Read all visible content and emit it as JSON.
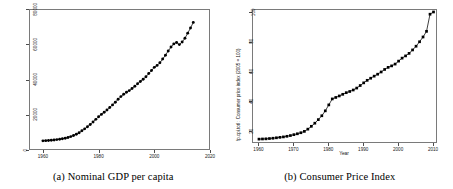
{
  "figure": {
    "background": "#ffffff",
    "marker_color": "#000000",
    "frame_color": "#7a7a7a"
  },
  "panels": [
    {
      "id": "panel-a",
      "caption": "(a) Nominal GDP per capita"
    },
    {
      "id": "panel-b",
      "caption": "(b) Consumer Price Index"
    }
  ],
  "chart_data": [
    {
      "type": "scatter",
      "title": "",
      "caption": "(a) Nominal GDP per capita",
      "xlabel": "",
      "ylabel": "",
      "xlim": [
        1955,
        2020
      ],
      "ylim": [
        0,
        80000
      ],
      "xticks": [
        1960,
        1980,
        2000,
        2020
      ],
      "yticks": [
        0,
        20000,
        40000,
        60000,
        80000
      ],
      "xtick_labels": [
        "1960",
        "1980",
        "2000",
        "2020"
      ],
      "ytick_labels": [
        "0",
        "20000",
        "40000",
        "60000",
        "80000"
      ],
      "grid": false,
      "legend": null,
      "marker": "filled-circle",
      "x": [
        1960,
        1961,
        1962,
        1963,
        1964,
        1965,
        1966,
        1967,
        1968,
        1969,
        1970,
        1971,
        1972,
        1973,
        1974,
        1975,
        1976,
        1977,
        1978,
        1979,
        1980,
        1981,
        1982,
        1983,
        1984,
        1985,
        1986,
        1987,
        1988,
        1989,
        1990,
        1991,
        1992,
        1993,
        1994,
        1995,
        1996,
        1997,
        1998,
        1999,
        2000,
        2001,
        2002,
        2003,
        2004,
        2005,
        2006,
        2007,
        2008,
        2009,
        2010,
        2011,
        2012,
        2013,
        2014
      ],
      "y": [
        5200,
        5300,
        5400,
        5500,
        5700,
        5900,
        6100,
        6400,
        6700,
        7100,
        7600,
        8200,
        8900,
        9800,
        10900,
        12000,
        13200,
        14500,
        15900,
        17400,
        18900,
        20200,
        21400,
        22700,
        24100,
        25600,
        27100,
        28800,
        30300,
        31600,
        32800,
        33700,
        34900,
        36200,
        37600,
        38900,
        40100,
        41600,
        43400,
        45100,
        46900,
        48000,
        49500,
        51600,
        53800,
        56200,
        58400,
        60200,
        61000,
        59800,
        61300,
        63400,
        66300,
        69200,
        72400
      ]
    },
    {
      "type": "scatter",
      "title": "",
      "caption": "(b) Consumer Price Index",
      "xlabel": "Year",
      "ylabel": "fp.cpi.totl : Consumer price index (2005 = 100)",
      "xlim": [
        1958,
        2011
      ],
      "ylim": [
        12,
        102
      ],
      "xticks": [
        1960,
        1970,
        1980,
        1990,
        2000,
        2010
      ],
      "yticks": [
        20,
        40,
        60,
        80,
        100
      ],
      "xtick_labels": [
        "1960",
        "1970",
        "1980",
        "1990",
        "2000",
        "2010"
      ],
      "ytick_labels": [
        "20",
        "40",
        "60",
        "80",
        "100"
      ],
      "grid": false,
      "legend": null,
      "marker": "filled-square",
      "x": [
        1960,
        1961,
        1962,
        1963,
        1964,
        1965,
        1966,
        1967,
        1968,
        1969,
        1970,
        1971,
        1972,
        1973,
        1974,
        1975,
        1976,
        1977,
        1978,
        1979,
        1980,
        1981,
        1982,
        1983,
        1984,
        1985,
        1986,
        1987,
        1988,
        1989,
        1990,
        1991,
        1992,
        1993,
        1994,
        1995,
        1996,
        1997,
        1998,
        1999,
        2000,
        2001,
        2002,
        2003,
        2004,
        2005,
        2006,
        2007,
        2008,
        2009,
        2010
      ],
      "y": [
        14.6,
        14.7,
        14.8,
        15.0,
        15.2,
        15.5,
        15.8,
        16.1,
        16.5,
        17.0,
        17.6,
        18.2,
        18.9,
        19.8,
        21.3,
        23.2,
        25.3,
        27.7,
        30.3,
        33.6,
        37.6,
        41.6,
        42.6,
        43.6,
        44.7,
        45.8,
        46.6,
        47.6,
        48.9,
        50.6,
        52.4,
        54.1,
        55.5,
        56.9,
        58.2,
        59.7,
        61.4,
        62.8,
        63.8,
        65.0,
        67.0,
        69.0,
        70.5,
        72.2,
        74.5,
        77.0,
        80.0,
        83.2,
        87.0,
        98.5,
        100.0
      ]
    }
  ]
}
